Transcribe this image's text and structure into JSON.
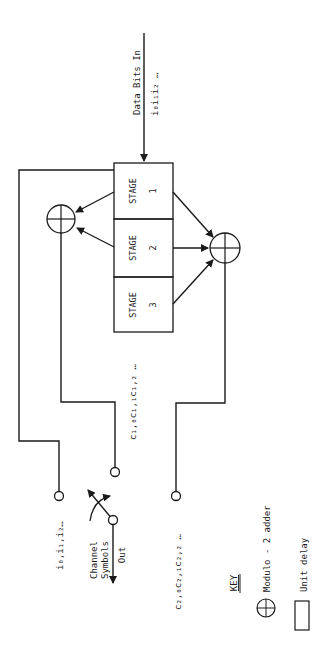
{
  "input": {
    "label": "Data Bits In",
    "sequence": "i₀i₁i₂ …"
  },
  "stages": [
    {
      "label": "STAGE",
      "number": "1"
    },
    {
      "label": "STAGE",
      "number": "2"
    },
    {
      "label": "STAGE",
      "number": "3"
    }
  ],
  "outputs": {
    "systematic": "i₀,i₁,i₂…",
    "c1": "c₁,₀c₁,₁c₁,₂ …",
    "c2": "c₂,₀c₂,₁c₂,₂ …",
    "switch_label_1": "Channel",
    "switch_label_2": "Symbols",
    "switch_label_3": "Out"
  },
  "key": {
    "title": "KEY",
    "adder": "Modulo - 2 adder",
    "delay": "Unit delay"
  },
  "colors": {
    "line": "#1a1a1a",
    "background": "#ffffff"
  }
}
